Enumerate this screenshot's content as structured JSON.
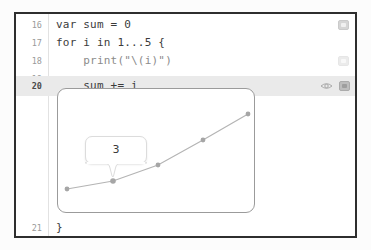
{
  "editor": {
    "lines": [
      {
        "number": "16",
        "code": "var sum = 0",
        "highlight": false,
        "badge": "result-badge",
        "badge_state": "normal",
        "eye": false
      },
      {
        "number": "17",
        "code": "for i in 1...5 {",
        "highlight": false,
        "badge": "none",
        "badge_state": "none",
        "eye": false
      },
      {
        "number": "18",
        "code": "    print(\"\\(i)\")",
        "highlight": false,
        "badge": "result-badge",
        "badge_state": "faint",
        "eye": false
      },
      {
        "number": "19",
        "code": "",
        "highlight": false,
        "badge": "none",
        "badge_state": "none",
        "eye": false
      },
      {
        "number": "20",
        "code": "    sum += i",
        "highlight": true,
        "badge": "result-badge",
        "badge_state": "strong",
        "eye": true
      },
      {
        "number": "21",
        "code": "}",
        "highlight": false,
        "badge": "none",
        "badge_state": "none",
        "eye": false
      }
    ],
    "icons": {
      "eye": "quicklook-eye-icon",
      "badge": "value-history-badge-icon"
    }
  },
  "callout": {
    "value": "3",
    "attached_to_point_index": 1
  },
  "colors": {
    "frame": "#2e2e2e",
    "highlight_row": "#eaeaea",
    "gutter_text": "#9a9a9a",
    "code_text": "#3b3b3b",
    "graph_border": "#9b9b9b",
    "graph_line": "#b4b4b4",
    "graph_point": "#a6a6a6",
    "bubble_bg": "#ffffff"
  },
  "chart_data": {
    "type": "line",
    "title": "",
    "xlabel": "",
    "ylabel": "",
    "categories": [
      "1",
      "2",
      "3",
      "4",
      "5"
    ],
    "x": [
      1,
      2,
      3,
      4,
      5
    ],
    "values": [
      1,
      3,
      6,
      10,
      15
    ],
    "series": [
      {
        "name": "sum",
        "values": [
          1,
          3,
          6,
          10,
          15
        ]
      }
    ],
    "annotations": [
      {
        "text": "3",
        "x": 2,
        "y": 3
      }
    ],
    "grid": false,
    "legend": "none",
    "xlim": [
      1,
      5
    ],
    "ylim": [
      1,
      15
    ],
    "points_px": [
      {
        "x": 9,
        "y": 100
      },
      {
        "x": 55,
        "y": 92
      },
      {
        "x": 100,
        "y": 76
      },
      {
        "x": 145,
        "y": 51
      },
      {
        "x": 190,
        "y": 25
      }
    ]
  }
}
